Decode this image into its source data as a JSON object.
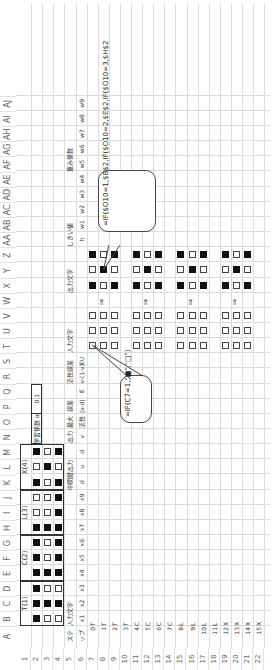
{
  "sheet": {
    "columns": [
      "A",
      "B",
      "C",
      "D",
      "E",
      "F",
      "G",
      "H",
      "I",
      "J",
      "K",
      "L",
      "M",
      "N",
      "O",
      "P",
      "Q",
      "R",
      "S",
      "T",
      "U",
      "V",
      "W",
      "X",
      "Y",
      "Z",
      "AA",
      "AB",
      "AC",
      "AD",
      "AE",
      "AF",
      "AG",
      "AH",
      "AI",
      "AJ"
    ],
    "rows": [
      "1",
      "2",
      "3",
      "4",
      "5",
      "6",
      "7",
      "8",
      "9",
      "10",
      "11",
      "12",
      "13",
      "14",
      "15",
      "16",
      "17",
      "18",
      "19",
      "20",
      "21",
      "22"
    ]
  },
  "patterns": {
    "labels": [
      "T(1)",
      "C(2)",
      "L(3)",
      "X(4)"
    ],
    "grid": [
      [
        1,
        1,
        1,
        1,
        1,
        1,
        1,
        0,
        0,
        1,
        0,
        1
      ],
      [
        0,
        1,
        0,
        1,
        0,
        0,
        1,
        0,
        0,
        0,
        1,
        0
      ],
      [
        0,
        1,
        0,
        1,
        1,
        1,
        1,
        1,
        1,
        1,
        0,
        1
      ]
    ]
  },
  "learning_rate": {
    "label": "学習係数 α",
    "value": "0.1"
  },
  "headers": {
    "row5": {
      "A": "ステ",
      "B": "入力文字",
      "K": "中間層出力",
      "N": "出力",
      "O": "最大",
      "P": "誤差",
      "R": "活性誤差",
      "T": "入力文字",
      "X": "出力文字",
      "AA": "しきい値",
      "AF": "重み係数"
    },
    "row6": {
      "A": "ップ",
      "B": "x1",
      "C": "x2",
      "D": "x3",
      "E": "x4",
      "F": "x5",
      "G": "x6",
      "H": "x7",
      "I": "x8",
      "J": "x9",
      "K": "d",
      "L": "u",
      "M": "d",
      "N": "v",
      "O": "活性",
      "P": "|v-d|",
      "Q": "E",
      "R": "v-(1-v)",
      "S": "EU",
      "AA": "h",
      "AB": "w1",
      "AC": "w2",
      "AD": "w3",
      "AE": "w4",
      "AF": "w5",
      "AG": "w6",
      "AH": "w7",
      "AI": "w8",
      "AJ": "w9"
    }
  },
  "steps": [
    {
      "n": "0",
      "c": "T"
    },
    {
      "n": "1",
      "c": "T"
    },
    {
      "n": "2",
      "c": "T"
    },
    {
      "n": "3",
      "c": "T"
    },
    {
      "n": "4",
      "c": "C"
    },
    {
      "n": "5",
      "c": "C"
    },
    {
      "n": "6",
      "c": "C"
    },
    {
      "n": "7",
      "c": "C"
    },
    {
      "n": "8",
      "c": "L"
    },
    {
      "n": "9",
      "c": "L"
    },
    {
      "n": "10",
      "c": "L"
    },
    {
      "n": "11",
      "c": "L"
    },
    {
      "n": "12",
      "c": "X"
    },
    {
      "n": "13",
      "c": "X"
    },
    {
      "n": "14",
      "c": "X"
    },
    {
      "n": "15",
      "c": "X"
    }
  ],
  "display_blocks": {
    "input": [
      [
        [
          0,
          0,
          0
        ],
        [
          0,
          0,
          0
        ],
        [
          0,
          0,
          0
        ]
      ],
      [
        [
          0,
          0,
          0
        ],
        [
          0,
          0,
          0
        ],
        [
          0,
          0,
          0
        ]
      ],
      [
        [
          0,
          0,
          0
        ],
        [
          0,
          0,
          0
        ],
        [
          0,
          0,
          0
        ]
      ],
      [
        [
          0,
          0,
          0
        ],
        [
          0,
          0,
          0
        ],
        [
          0,
          0,
          0
        ]
      ]
    ],
    "output": [
      [
        [
          1,
          0,
          1
        ],
        [
          0,
          1,
          0
        ],
        [
          1,
          0,
          1
        ]
      ],
      [
        [
          1,
          0,
          1
        ],
        [
          0,
          1,
          0
        ],
        [
          1,
          0,
          1
        ]
      ],
      [
        [
          1,
          0,
          1
        ],
        [
          0,
          1,
          0
        ],
        [
          1,
          0,
          1
        ]
      ],
      [
        [
          1,
          0,
          1
        ],
        [
          0,
          1,
          0
        ],
        [
          1,
          0,
          1
        ]
      ]
    ],
    "arrow": "⇑"
  },
  "callouts": {
    "input_formula": "=IF(C7=1,\"■\",\"□\")",
    "output_formula": "=IF($O10=1,$B$2,IF($O10=2,$E$2,IF($O10=3,$H$2"
  }
}
